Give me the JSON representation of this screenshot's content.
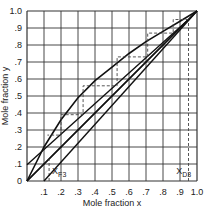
{
  "chart_data": {
    "type": "line",
    "title": "",
    "xlabel": "Mole fraction x",
    "ylabel": "Mole fraction y",
    "xlim": [
      0,
      1.0
    ],
    "ylim": [
      0,
      1.0
    ],
    "grid": true,
    "x_ticks": [
      "0",
      ".1",
      ".2",
      ".3",
      ".4",
      ".5",
      ".6",
      ".7",
      ".8",
      ".9",
      "1.0"
    ],
    "y_ticks": [
      "0",
      ".1",
      ".2",
      ".3",
      ".4",
      ".5",
      ".6",
      ".7",
      ".8",
      ".9",
      "1.0"
    ],
    "annotations": [
      {
        "text": "X",
        "sub": "F3",
        "x": 0.13,
        "y": 0.06
      },
      {
        "text": "X",
        "sub": "D3",
        "x": 0.86,
        "y": 0.06
      }
    ],
    "series": [
      {
        "name": "equilibrium curve",
        "x": [
          0,
          0.05,
          0.1,
          0.2,
          0.3,
          0.4,
          0.5,
          0.6,
          0.7,
          0.8,
          0.9,
          1.0
        ],
        "y": [
          0,
          0.1,
          0.2,
          0.36,
          0.49,
          0.59,
          0.67,
          0.75,
          0.82,
          0.88,
          0.94,
          1.0
        ]
      },
      {
        "name": "diagonal y=x",
        "x": [
          0,
          1.0
        ],
        "y": [
          0,
          1.0
        ]
      },
      {
        "name": "rectifying operating line",
        "x": [
          0,
          0.95
        ],
        "y": [
          0.095,
          0.95
        ]
      },
      {
        "name": "stripping operating line",
        "x": [
          0.12,
          1.0
        ],
        "y": [
          0.12,
          1.0
        ],
        "note": "lower line from xF to top, roughly parallel"
      },
      {
        "name": "stages (dashed)",
        "x": [
          0.95,
          0.86,
          0.86,
          0.71,
          0.71,
          0.53,
          0.53,
          0.33,
          0.33,
          0.2,
          0.2,
          0.12
        ],
        "y": [
          0.95,
          0.95,
          0.87,
          0.87,
          0.73,
          0.73,
          0.56,
          0.56,
          0.39,
          0.39,
          0.27,
          0.27
        ]
      },
      {
        "name": "xF3 marker",
        "x": [
          0.13,
          0.13
        ],
        "y": [
          0,
          0.13
        ]
      },
      {
        "name": "xD3 marker",
        "x": [
          0.95,
          0.95
        ],
        "y": [
          0,
          0.95
        ]
      }
    ]
  },
  "labels": {
    "xlabel": "Mole fraction x",
    "ylabel": "Mole fraction y",
    "xf": "X",
    "xf_sub": "F3",
    "xd": "X",
    "xd_sub": "D3"
  },
  "ticks": {
    "x": [
      "0",
      ".1",
      ".2",
      ".3",
      ".4",
      ".5",
      ".6",
      ".7",
      ".8",
      ".9",
      "1.0"
    ],
    "y": [
      "0",
      ".1",
      ".2",
      ".3",
      ".4",
      ".5",
      ".6",
      ".7",
      ".8",
      ".9",
      "1.0"
    ]
  }
}
